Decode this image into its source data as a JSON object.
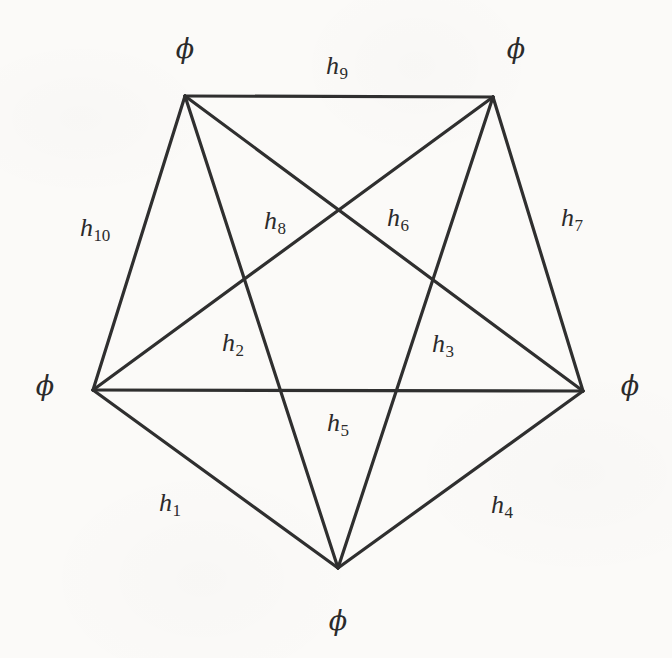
{
  "figure": {
    "kind": "graph-diagram",
    "background_color": "#fbfaf8",
    "line_color": "#2f2f2f",
    "text_color": "#2b2b2b",
    "width": 672,
    "height": 658
  },
  "chart_data": {
    "type": "diagram",
    "title": "",
    "vertices": [
      {
        "id": "v-top-left",
        "label": "ϕ",
        "x": 185,
        "y": 96,
        "label_x": 185,
        "label_y": 48
      },
      {
        "id": "v-top-right",
        "label": "ϕ",
        "x": 493,
        "y": 97,
        "label_x": 516,
        "label_y": 48
      },
      {
        "id": "v-left",
        "label": "ϕ",
        "x": 93,
        "y": 390,
        "label_x": 45,
        "label_y": 385
      },
      {
        "id": "v-right",
        "label": "ϕ",
        "x": 583,
        "y": 391,
        "label_x": 630,
        "label_y": 385
      },
      {
        "id": "v-bottom",
        "label": "ϕ",
        "x": 338,
        "y": 568,
        "label_x": 338,
        "label_y": 620
      }
    ],
    "edges": [
      {
        "id": "e-h1",
        "label": "h",
        "sub": "1",
        "from": "v-left",
        "to": "v-bottom",
        "label_x": 170,
        "label_y": 505
      },
      {
        "id": "e-h2",
        "label": "h",
        "sub": "2",
        "from": "v-top-left",
        "to": "v-bottom",
        "label_x": 233,
        "label_y": 345
      },
      {
        "id": "e-h3",
        "label": "h",
        "sub": "3",
        "from": "v-top-right",
        "to": "v-bottom",
        "label_x": 443,
        "label_y": 346
      },
      {
        "id": "e-h4",
        "label": "h",
        "sub": "4",
        "from": "v-bottom",
        "to": "v-right",
        "label_x": 502,
        "label_y": 507
      },
      {
        "id": "e-h5",
        "label": "h",
        "sub": "5",
        "from": "v-left",
        "to": "v-right",
        "label_x": 338,
        "label_y": 425
      },
      {
        "id": "e-h6",
        "label": "h",
        "sub": "6",
        "from": "v-top-right",
        "to": "v-left",
        "label_x": 398,
        "label_y": 220
      },
      {
        "id": "e-h7",
        "label": "h",
        "sub": "7",
        "from": "v-top-right",
        "to": "v-right",
        "label_x": 572,
        "label_y": 220
      },
      {
        "id": "e-h8",
        "label": "h",
        "sub": "8",
        "from": "v-top-left",
        "to": "v-right",
        "label_x": 275,
        "label_y": 223
      },
      {
        "id": "e-h9",
        "label": "h",
        "sub": "9",
        "from": "v-top-left",
        "to": "v-top-right",
        "label_x": 337,
        "label_y": 68
      },
      {
        "id": "e-h10",
        "label": "h",
        "sub": "10",
        "from": "v-top-left",
        "to": "v-left",
        "label_x": 95,
        "label_y": 230
      }
    ],
    "edge_count": 10,
    "vertex_count": 5
  }
}
